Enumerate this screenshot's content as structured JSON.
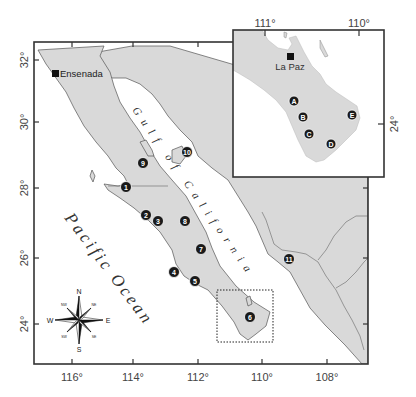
{
  "main_map": {
    "lon_ticks": [
      {
        "label": "116°",
        "x": 72
      },
      {
        "label": "114°",
        "x": 133
      },
      {
        "label": "112°",
        "x": 198
      },
      {
        "label": "110°",
        "x": 262
      },
      {
        "label": "108°",
        "x": 327
      }
    ],
    "lat_ticks": [
      {
        "label": "32°",
        "y": 60
      },
      {
        "label": "30°",
        "y": 122
      },
      {
        "label": "28°",
        "y": 188
      },
      {
        "label": "26°",
        "y": 258
      },
      {
        "label": "24°",
        "y": 324
      }
    ],
    "city": {
      "label": "Ensenada"
    },
    "ocean_label": "Pacific Ocean",
    "gulf_label": "Gulf of California",
    "sites": [
      {
        "id": "1",
        "x": 126,
        "y": 187
      },
      {
        "id": "2",
        "x": 146,
        "y": 215
      },
      {
        "id": "3",
        "x": 158,
        "y": 221
      },
      {
        "id": "4",
        "x": 174,
        "y": 272
      },
      {
        "id": "5",
        "x": 195,
        "y": 281
      },
      {
        "id": "6",
        "x": 250,
        "y": 317
      },
      {
        "id": "7",
        "x": 201,
        "y": 249
      },
      {
        "id": "8",
        "x": 185,
        "y": 221
      },
      {
        "id": "9",
        "x": 143,
        "y": 163
      },
      {
        "id": "10",
        "x": 187,
        "y": 152
      },
      {
        "id": "11",
        "x": 289,
        "y": 259
      }
    ]
  },
  "compass": {
    "N": "N",
    "S": "S",
    "E": "E",
    "W": "W",
    "NE": "NE",
    "NW": "NW",
    "SE": "SE",
    "SW": "SW"
  },
  "inset_map": {
    "lon_ticks": [
      {
        "label": "111°",
        "x": 265
      },
      {
        "label": "110°",
        "x": 359
      }
    ],
    "lat_ticks": [
      {
        "label": "24°",
        "y": 124
      }
    ],
    "city": {
      "label": "La Paz"
    },
    "sites": [
      {
        "id": "A",
        "x": 294,
        "y": 101
      },
      {
        "id": "B",
        "x": 303,
        "y": 117
      },
      {
        "id": "C",
        "x": 309,
        "y": 134
      },
      {
        "id": "D",
        "x": 331,
        "y": 144
      },
      {
        "id": "E",
        "x": 352,
        "y": 115
      }
    ]
  }
}
